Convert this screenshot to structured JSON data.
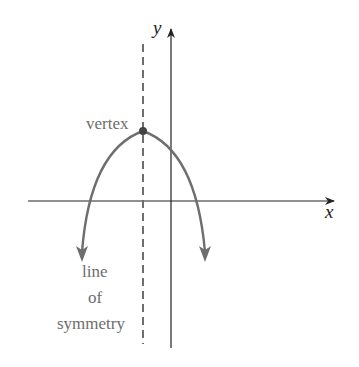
{
  "diagram": {
    "labels": {
      "x_axis": "x",
      "y_axis": "y",
      "vertex": "vertex",
      "symmetry_line": [
        "line",
        "of",
        "symmetry"
      ]
    },
    "colors": {
      "axes": "#222222",
      "curve": "#6e6e6e",
      "dashed_line": "#6e6e6e",
      "label_text": "#6e6e6e"
    },
    "curve": {
      "type": "parabola",
      "opens": "down",
      "vertex_left_of_y_axis": true
    }
  }
}
